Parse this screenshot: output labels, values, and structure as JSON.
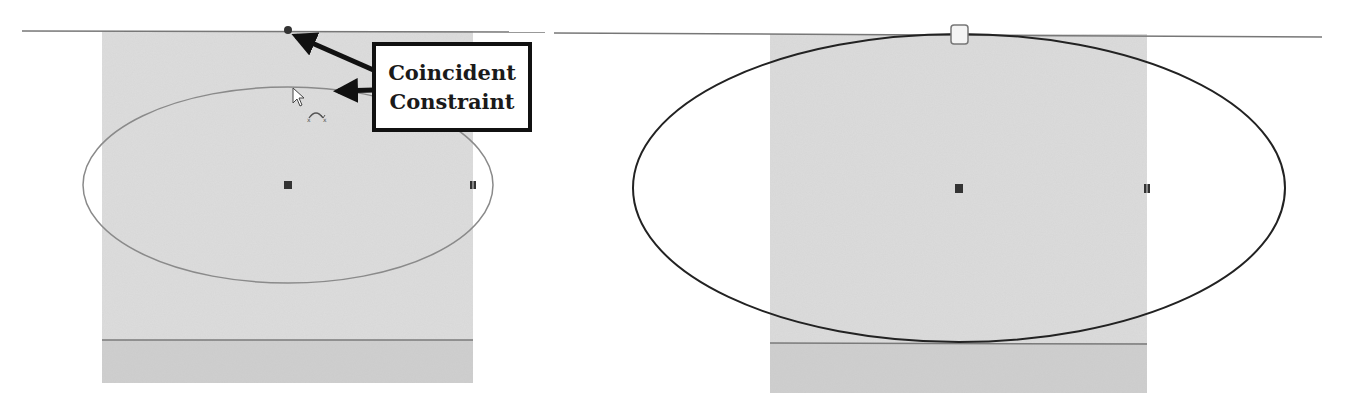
{
  "callout": {
    "line1": "Coincident",
    "line2": "Constraint"
  },
  "colors": {
    "background": "#ffffff",
    "part_face": "#dcdcdc",
    "part_band": "#cfcfcf",
    "left_ellipse": "#8a8a8a",
    "right_ellipse": "#222222",
    "horizontal_line": "#777777",
    "arrow": "#111111",
    "point": "#333333"
  },
  "left_view": {
    "ellipse": {
      "cx": 288,
      "cy": 185,
      "rx": 205,
      "ry": 98
    },
    "center_point": {
      "x": 288,
      "y": 185
    },
    "major_axis_point": {
      "x": 473,
      "y": 185
    },
    "coincident_target_point": {
      "x": 288,
      "y": 31
    },
    "cursor_icon": "arrow-cursor-icon",
    "constraint_icon": "coincident-cursor-badge-icon"
  },
  "right_view": {
    "ellipse": {
      "cx": 409,
      "cy": 188,
      "rx": 326,
      "ry": 155
    },
    "center_point": {
      "x": 409,
      "y": 188
    },
    "major_axis_point": {
      "x": 597,
      "y": 188
    },
    "constraint_marker": "coincident-constraint-icon"
  }
}
